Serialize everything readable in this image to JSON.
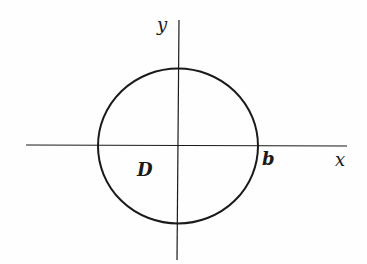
{
  "diagram": {
    "axes": {
      "x_label": "x",
      "y_label": "y"
    },
    "region_label": "D",
    "radius_label": "b",
    "colors": {
      "stroke": "#1a1a1a",
      "background": "#fefefe"
    }
  }
}
